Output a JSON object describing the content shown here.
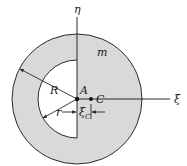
{
  "diagram": {
    "colors": {
      "fill": "#d9d9d9",
      "stroke": "#2b2b2b",
      "background": "#ffffff"
    },
    "labels": {
      "eta_axis": "η",
      "xi_axis": "ξ",
      "mass": "m",
      "outer_radius": "R",
      "inner_radius": "r",
      "origin_point": "A",
      "centroid_point": "C",
      "offset_main": "ξ",
      "offset_sub": "C"
    },
    "geometry": {
      "center": [
        77,
        99
      ],
      "outer_radius_px": 65,
      "inner_radius_px": 39,
      "centroid": [
        91,
        99
      ]
    }
  }
}
